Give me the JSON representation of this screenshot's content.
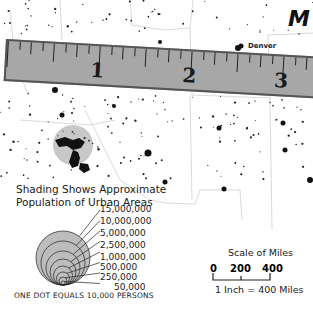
{
  "map": {
    "state_label": "M",
    "city_label": "Denver",
    "ruler": {
      "numbers": [
        "1",
        "2",
        "3"
      ],
      "fill_color": "#a7a7a7"
    },
    "legend": {
      "title_line1": "Shading Shows Approximate",
      "title_line2": "Population of Urban Areas",
      "population_levels": [
        "15,000,000",
        "10,000,000",
        "5,000,000",
        "2,500,000",
        "1,000,000",
        "500,000",
        "250,000",
        "50,000"
      ],
      "dot_note": "ONE DOT EQUALS 10,000 PERSONS"
    },
    "scale": {
      "title": "Scale of Miles",
      "ticks": [
        "0",
        "200",
        "400"
      ],
      "equivalence": "1 Inch = 400 Miles"
    }
  }
}
